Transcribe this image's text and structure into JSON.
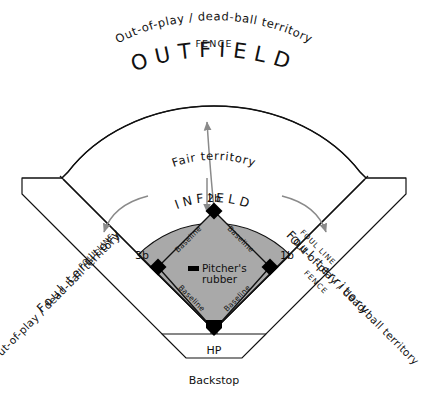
{
  "diagram": {
    "colors": {
      "infield_fill": "#a9a9a9",
      "line": "#111111",
      "arrow": "#8a8a8a",
      "background": "#ffffff",
      "base_marker": "#000000"
    }
  },
  "labels": {
    "fence_top": "FENCE",
    "fence_right": "FENCE",
    "outfield": "OUTFIELD",
    "infield": "INFIELD",
    "fair_territory": "Fair territory",
    "foul_territory_left": "Foul territory",
    "foul_territory_right": "Foul territory",
    "foul_line_left": "FOUL LINE",
    "foul_line_right": "FOUL LINE",
    "out_of_play_top": "Out-of-play / dead-ball territory",
    "out_of_play_left": "Out-of-play / dead-ball territory",
    "out_of_play_right": "Out-of-play / dead-ball territory",
    "backstop": "Backstop",
    "pitchers_rubber_line1": "Pitcher's",
    "pitchers_rubber_line2": "rubber"
  },
  "bases": [
    {
      "id": "second-base",
      "label": "2b"
    },
    {
      "id": "third-base",
      "label": "3b"
    },
    {
      "id": "first-base",
      "label": "1b"
    },
    {
      "id": "home-plate",
      "label": "HP"
    }
  ],
  "baselines": [
    {
      "id": "baseline-3b-2b",
      "label": "Baseline"
    },
    {
      "id": "baseline-2b-1b",
      "label": "Baseline"
    },
    {
      "id": "baseline-hp-3b",
      "label": "Baseline"
    },
    {
      "id": "baseline-1b-hp",
      "label": "Baseline"
    }
  ]
}
